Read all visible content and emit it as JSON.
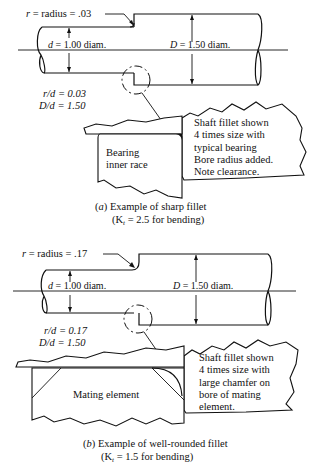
{
  "figure_a": {
    "radius_label": "r = radius = .03",
    "radius_r": "r",
    "radius_rest": " = radius = .03",
    "small_diam_var": "d",
    "small_diam_rest": " = 1.00  diam.",
    "large_diam_var": "D",
    "large_diam_rest": " = 1.50  diam.",
    "ratio_rd": "r/d = 0.03",
    "ratio_Dd": "D/d = 1.50",
    "note_lines": [
      "Shaft fillet shown",
      "4 times size with",
      "typical bearing",
      "Bore radius added.",
      "Note clearance."
    ],
    "element_label_lines": [
      "Bearing",
      "inner race"
    ],
    "caption_letter": "a",
    "caption_title": "Example of sharp fillet",
    "caption_kt_prefix": "(K",
    "caption_kt_sub": "t",
    "caption_kt_suffix": " = 2.5 for bending)"
  },
  "figure_b": {
    "radius_r": "r",
    "radius_rest": " = radius = .17",
    "small_diam_var": "d",
    "small_diam_rest": " = 1.00  diam.",
    "large_diam_var": "D",
    "large_diam_rest": " = 1.50  diam.",
    "ratio_rd": "r/d = 0.17",
    "ratio_Dd": "D/d = 1.50",
    "note_lines": [
      "Shaft fillet shown",
      "4 times size with",
      "large chamfer on",
      "bore of mating",
      "element."
    ],
    "element_label": "Mating element",
    "caption_letter": "b",
    "caption_title": "Example of well-rounded fillet",
    "caption_kt_prefix": "(K",
    "caption_kt_sub": "t",
    "caption_kt_suffix": " = 1.5 for bending)"
  }
}
